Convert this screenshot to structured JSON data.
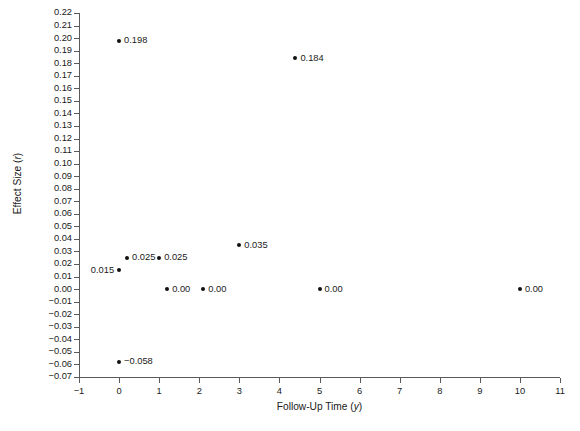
{
  "chart_data": {
    "type": "scatter",
    "title": "",
    "xlabel": "Follow-Up Time (y)",
    "ylabel": "Effect Size (r)",
    "xlabel_text": "Follow-Up Time",
    "xlabel_italic": "y",
    "ylabel_text": "Effect Size",
    "ylabel_italic": "r",
    "xlim": [
      -1,
      11
    ],
    "ylim": [
      -0.07,
      0.22
    ],
    "grid": false,
    "legend": "none",
    "xticks": [
      "−1",
      "0",
      "1",
      "2",
      "3",
      "4",
      "5",
      "6",
      "7",
      "8",
      "9",
      "10",
      "11"
    ],
    "xtick_values": [
      -1,
      0,
      1,
      2,
      3,
      4,
      5,
      6,
      7,
      8,
      9,
      10,
      11
    ],
    "yticks": [
      "0.22",
      "0.21",
      "0.20",
      "0.19",
      "0.18",
      "0.17",
      "0.16",
      "0.15",
      "0.14",
      "0.13",
      "0.12",
      "0.11",
      "0.10",
      "0.09",
      "0.08",
      "0.07",
      "0.06",
      "0.05",
      "0.04",
      "0.03",
      "0.02",
      "0.01",
      "0.00",
      "−0.01",
      "−0.02",
      "−0.03",
      "−0.04",
      "−0.05",
      "−0.06",
      "−0.07"
    ],
    "ytick_values": [
      0.22,
      0.21,
      0.2,
      0.19,
      0.18,
      0.17,
      0.16,
      0.15,
      0.14,
      0.13,
      0.12,
      0.11,
      0.1,
      0.09,
      0.08,
      0.07,
      0.06,
      0.05,
      0.04,
      0.03,
      0.02,
      0.01,
      0.0,
      -0.01,
      -0.02,
      -0.03,
      -0.04,
      -0.05,
      -0.06,
      -0.07
    ],
    "points": [
      {
        "x": 0,
        "y": 0.198,
        "label": "0.198",
        "label_side": "right"
      },
      {
        "x": 4.4,
        "y": 0.184,
        "label": "0.184",
        "label_side": "right"
      },
      {
        "x": 3,
        "y": 0.035,
        "label": "0.035",
        "label_side": "right"
      },
      {
        "x": 0.2,
        "y": 0.025,
        "label": "0.025",
        "label_side": "right"
      },
      {
        "x": 1.0,
        "y": 0.025,
        "label": "0.025",
        "label_side": "right"
      },
      {
        "x": 0,
        "y": 0.015,
        "label": "0.015",
        "label_side": "left"
      },
      {
        "x": 1.2,
        "y": 0.0,
        "label": "0.00",
        "label_side": "right"
      },
      {
        "x": 2.1,
        "y": 0.0,
        "label": "0.00",
        "label_side": "right"
      },
      {
        "x": 5.0,
        "y": 0.0,
        "label": "0.00",
        "label_side": "right"
      },
      {
        "x": 10.0,
        "y": 0.0,
        "label": "0.00",
        "label_side": "right"
      },
      {
        "x": 0,
        "y": -0.058,
        "label": "−0.058",
        "label_side": "right"
      }
    ],
    "marker": "filled-circle",
    "marker_color": "#111111",
    "axis_color": "#5a5a5a",
    "background": "#ffffff"
  },
  "caption": {
    "text": ""
  }
}
